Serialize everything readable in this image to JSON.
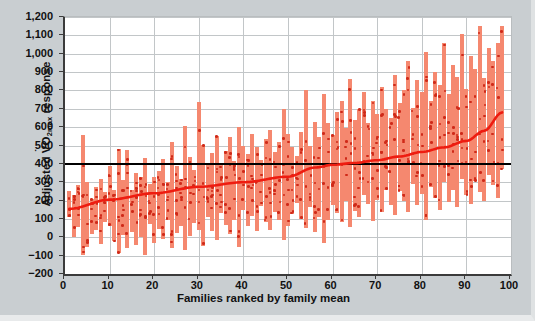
{
  "chart_data": {
    "type": "bar",
    "title": "",
    "subtitle": "",
    "xlabel": "Families ranked by family mean",
    "ylabel": "Adjusted V̇O2max response",
    "ylabel_parts": {
      "prefix": "Adjusted ",
      "symbol": "VO",
      "sub": "2max",
      "suffix": " response"
    },
    "xlim": [
      0,
      100
    ],
    "ylim": [
      -200,
      1200
    ],
    "ytick_step": 100,
    "xtick_step": 10,
    "xticks": [
      0,
      10,
      20,
      30,
      40,
      50,
      60,
      70,
      80,
      90,
      100
    ],
    "yticks": [
      1200,
      1100,
      1000,
      900,
      800,
      700,
      600,
      500,
      400,
      300,
      200,
      100,
      0,
      -100,
      -200
    ],
    "ytick_labels": [
      "1,200",
      "1,100",
      "1,000",
      "900",
      "800",
      "700",
      "600",
      "500",
      "400",
      "300",
      "200",
      "100",
      "0",
      "-100",
      "-200"
    ],
    "xtick_labels": [
      "0",
      "10",
      "20",
      "30",
      "40",
      "50",
      "60",
      "70",
      "80",
      "90",
      "100"
    ],
    "grid": true,
    "legend": "none",
    "colors": {
      "bar": "#f5886f",
      "dot": "#cf2a19",
      "trend": "#ee1c10",
      "reference_line": "#000000",
      "grid": "#c2c6c8",
      "axis": "#3b3b3b",
      "plot_background": "#ffffff",
      "figure_background": "#c9ced1"
    },
    "annotations": [
      {
        "name": "reference-line",
        "type": "hline",
        "y": 400,
        "color": "#000000"
      },
      {
        "name": "trend-line",
        "type": "smoothed-mean",
        "color": "#ee1c10"
      }
    ],
    "series": [
      {
        "name": "Family range (min–max of individual adjusted responses)",
        "type": "range-bar",
        "x": [
          1,
          2,
          3,
          4,
          5,
          6,
          7,
          8,
          9,
          10,
          11,
          12,
          13,
          14,
          15,
          16,
          17,
          18,
          19,
          20,
          21,
          22,
          23,
          24,
          25,
          26,
          27,
          28,
          29,
          30,
          31,
          32,
          33,
          34,
          35,
          36,
          37,
          38,
          39,
          40,
          41,
          42,
          43,
          44,
          45,
          46,
          47,
          48,
          49,
          50,
          51,
          52,
          53,
          54,
          55,
          56,
          57,
          58,
          59,
          60,
          61,
          62,
          63,
          64,
          65,
          66,
          67,
          68,
          69,
          70,
          71,
          72,
          73,
          74,
          75,
          76,
          77,
          78,
          79,
          80,
          81,
          82,
          83,
          84,
          85,
          86,
          87,
          88,
          89,
          90,
          91,
          92,
          93,
          94,
          95,
          96,
          97,
          98
        ],
        "low": [
          110,
          0,
          55,
          -95,
          -55,
          20,
          40,
          -35,
          85,
          60,
          -20,
          -85,
          15,
          -60,
          30,
          -40,
          0,
          -95,
          70,
          -30,
          45,
          -10,
          95,
          -60,
          25,
          60,
          -70,
          5,
          80,
          40,
          -45,
          110,
          35,
          -15,
          130,
          65,
          20,
          95,
          -55,
          150,
          60,
          115,
          35,
          170,
          85,
          40,
          140,
          95,
          -15,
          60,
          125,
          185,
          100,
          50,
          165,
          30,
          110,
          -30,
          95,
          175,
          130,
          85,
          200,
          55,
          145,
          110,
          230,
          180,
          90,
          205,
          140,
          260,
          175,
          120,
          250,
          200,
          140,
          290,
          175,
          235,
          95,
          275,
          215,
          150,
          300,
          190,
          255,
          165,
          320,
          230,
          180,
          305,
          245,
          200,
          340,
          285,
          215,
          370
        ],
        "high": [
          250,
          230,
          285,
          555,
          300,
          210,
          275,
          320,
          245,
          390,
          260,
          480,
          310,
          475,
          255,
          350,
          330,
          430,
          290,
          330,
          360,
          425,
          300,
          520,
          390,
          315,
          605,
          440,
          365,
          735,
          505,
          400,
          460,
          550,
          395,
          470,
          545,
          415,
          600,
          500,
          455,
          560,
          490,
          420,
          535,
          585,
          465,
          520,
          700,
          560,
          490,
          445,
          575,
          805,
          500,
          630,
          545,
          780,
          620,
          555,
          680,
          740,
          595,
          860,
          640,
          700,
          790,
          620,
          745,
          670,
          820,
          700,
          650,
          885,
          730,
          800,
          960,
          705,
          855,
          790,
          1010,
          745,
          900,
          830,
          1060,
          780,
          940,
          875,
          1105,
          810,
          985,
          915,
          1150,
          870,
          1030,
          960,
          1060,
          1150
        ]
      },
      {
        "name": "Individual adjusted responses",
        "type": "scatter",
        "points_per_family": "4 to 6",
        "marker": "small filled square/dot",
        "color": "#cf2a19"
      },
      {
        "name": "Family mean (ranked trend)",
        "type": "line",
        "color": "#ee1c10",
        "x": [
          1,
          10,
          20,
          30,
          40,
          50,
          56,
          60,
          65,
          70,
          75,
          80,
          85,
          90,
          94,
          98
        ],
        "y": [
          155,
          205,
          240,
          275,
          300,
          330,
          380,
          395,
          405,
          420,
          440,
          465,
          490,
          525,
          580,
          680
        ]
      }
    ]
  },
  "axes": {
    "y_axis_name": "y-axis",
    "x_axis_name": "x-axis"
  }
}
